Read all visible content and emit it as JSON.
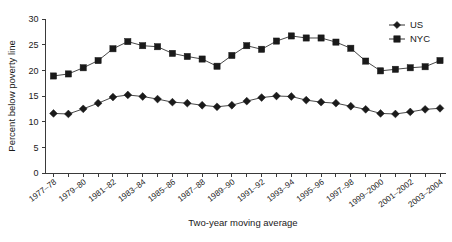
{
  "chart_data": {
    "type": "line",
    "title": "",
    "xlabel": "Two-year moving average",
    "ylabel": "Percent below poverty line",
    "ylim": [
      0,
      30
    ],
    "ytick_values": [
      0,
      5,
      10,
      15,
      20,
      25,
      30
    ],
    "ytick_labels": [
      "0",
      "5",
      "10",
      "15",
      "20",
      "25",
      "30"
    ],
    "grid": false,
    "legend_position": "top-right",
    "categories": [
      "1977-78",
      "1978-79",
      "1979-80",
      "1980-81",
      "1981-82",
      "1982-83",
      "1983-84",
      "1984-85",
      "1985-86",
      "1986-87",
      "1987-88",
      "1988-89",
      "1989-90",
      "1990-91",
      "1991-92",
      "1992-93",
      "1993-94",
      "1994-95",
      "1995-96",
      "1996-97",
      "1997-98",
      "1998-99",
      "1999-2000",
      "2000-2001",
      "2001-2002",
      "2002-2003",
      "2003-2004"
    ],
    "xtick_labels": [
      "1977–78",
      "1979–80",
      "1981–82",
      "1983–84",
      "1985–86",
      "1987–88",
      "1989–90",
      "1991–92",
      "1993–94",
      "1995–96",
      "1997–98",
      "1999–2000",
      "2001–2002",
      "2003–2004"
    ],
    "series": [
      {
        "name": "US",
        "marker": "diamond",
        "color": "#1a1a1a",
        "values": [
          11.6,
          11.5,
          12.5,
          13.6,
          14.8,
          15.2,
          14.9,
          14.4,
          13.8,
          13.6,
          13.2,
          12.9,
          13.2,
          14.0,
          14.7,
          15.0,
          14.9,
          14.2,
          13.8,
          13.6,
          13.0,
          12.4,
          11.6,
          11.5,
          11.9,
          12.4,
          12.6
        ]
      },
      {
        "name": "NYC",
        "marker": "square",
        "color": "#1a1a1a",
        "values": [
          18.9,
          19.3,
          20.5,
          21.9,
          24.2,
          25.6,
          24.8,
          24.6,
          23.3,
          22.7,
          22.2,
          20.8,
          22.9,
          24.8,
          24.1,
          25.7,
          26.7,
          26.3,
          26.3,
          25.5,
          24.3,
          21.8,
          19.9,
          20.2,
          20.5,
          20.7,
          21.9
        ]
      }
    ]
  },
  "legend": {
    "items": [
      {
        "label": "US"
      },
      {
        "label": "NYC"
      }
    ]
  },
  "axes": {
    "y_title": "Percent below poverty line",
    "x_title": "Two-year moving average"
  }
}
